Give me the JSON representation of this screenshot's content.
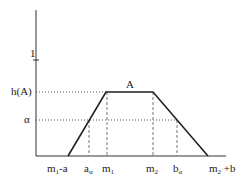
{
  "diagram": {
    "set_label": "A",
    "y_labels": {
      "one": "1",
      "height": "h(A)",
      "alpha": "α"
    },
    "x_labels": {
      "m1_minus_a": {
        "base": "m",
        "sub": "1",
        "rest": "-a"
      },
      "a_alpha": {
        "base": "a",
        "sub": "α"
      },
      "m1": {
        "base": "m",
        "sub": "1"
      },
      "m2": {
        "base": "m",
        "sub": "2"
      },
      "b_alpha": {
        "base": "b",
        "sub": "α"
      },
      "m2_plus_b": {
        "base": "m",
        "sub": "2",
        "rest": " +b"
      }
    },
    "colors": {
      "line": "#222222",
      "dotted": "#555555",
      "dashed": "#777777"
    }
  }
}
